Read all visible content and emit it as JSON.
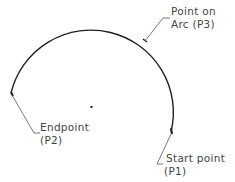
{
  "diagram": {
    "type": "three-point arc construction",
    "labels": {
      "p3_line1": "Point on",
      "p3_line2": "Arc (P3)",
      "p2_line1": "Endpoint",
      "p2_line2": "(P2)",
      "p1_line1": "Start point",
      "p1_line2": "(P1)"
    },
    "colors": {
      "arc": "#222222",
      "leader": "#555555",
      "text": "#444444"
    }
  }
}
